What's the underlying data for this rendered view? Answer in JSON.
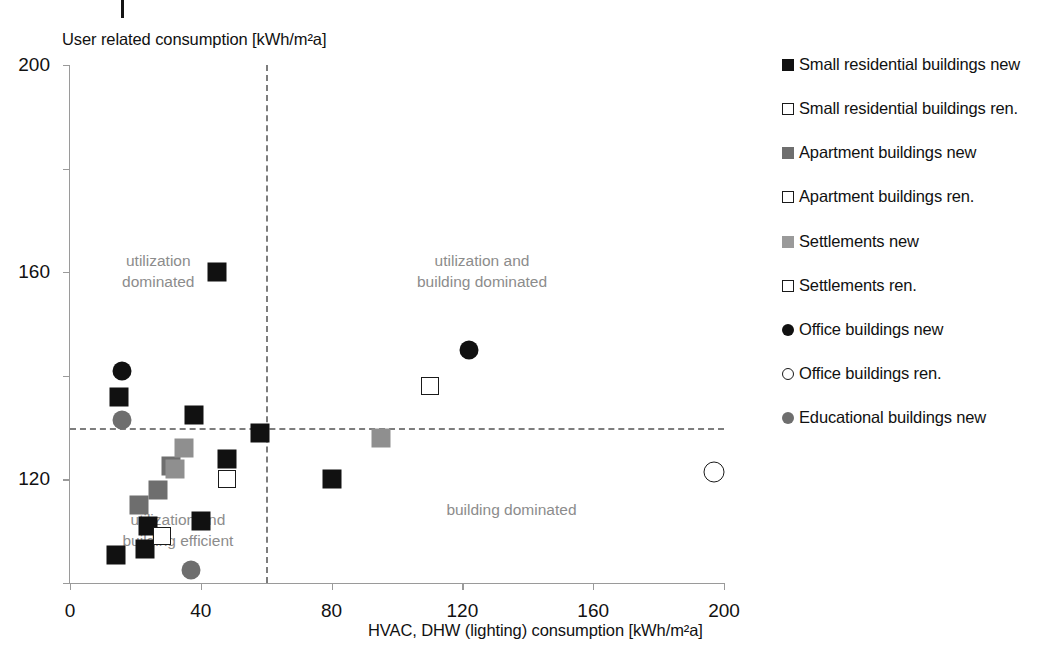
{
  "chart_data": {
    "type": "scatter",
    "title": "",
    "xlabel": "HVAC, DHW (lighting) consumption [kWh/m²a]",
    "ylabel": "User related consumption [kWh/m²a]",
    "xlim": [
      0,
      200
    ],
    "ylim": [
      0,
      200
    ],
    "xticks": [
      0,
      40,
      80,
      120,
      160,
      200
    ],
    "yticks": [
      0,
      40,
      80,
      120,
      160,
      200
    ],
    "grid": false,
    "legend_position": "right",
    "reference_lines": {
      "vertical_x": 60,
      "horizontal_y": 60,
      "style": "dashed",
      "color": "#7d7d7d"
    },
    "annotations": [
      {
        "text": "utilization\ndominated",
        "x": 27,
        "y": 128,
        "color": "#8c8c8c"
      },
      {
        "text": "utilization and\nbuilding  dominated",
        "x": 126,
        "y": 128,
        "color": "#8c8c8c"
      },
      {
        "text": "utilization and\nbuilding  efficient",
        "x": 33,
        "y": 28,
        "color": "#8c8c8c"
      },
      {
        "text": "building  dominated",
        "x": 135,
        "y": 32,
        "color": "#8c8c8c"
      }
    ],
    "series": [
      {
        "name": "Small residential buildings new",
        "marker": "square",
        "fill": "#111111",
        "points": [
          {
            "x": 15,
            "y": 72
          },
          {
            "x": 45,
            "y": 120
          },
          {
            "x": 38,
            "y": 65
          },
          {
            "x": 58,
            "y": 58
          },
          {
            "x": 48,
            "y": 48
          },
          {
            "x": 80,
            "y": 40
          },
          {
            "x": 40,
            "y": 24
          },
          {
            "x": 24,
            "y": 22
          },
          {
            "x": 23,
            "y": 13
          },
          {
            "x": 14,
            "y": 11
          }
        ]
      },
      {
        "name": "Small residential buildings ren.",
        "marker": "square",
        "fill": "#ffffff",
        "points": [
          {
            "x": 48,
            "y": 40
          },
          {
            "x": 28,
            "y": 18
          }
        ]
      },
      {
        "name": "Apartment buildings new",
        "marker": "square",
        "fill": "#6e6e6e",
        "points": [
          {
            "x": 31,
            "y": 45
          },
          {
            "x": 27,
            "y": 36
          },
          {
            "x": 21,
            "y": 30
          }
        ]
      },
      {
        "name": "Apartment buildings ren.",
        "marker": "square",
        "fill": "#ffffff",
        "points": []
      },
      {
        "name": "Settlements new",
        "marker": "square",
        "fill": "#9a9a9a",
        "points": [
          {
            "x": 35,
            "y": 52
          },
          {
            "x": 32,
            "y": 44
          },
          {
            "x": 95,
            "y": 56
          }
        ]
      },
      {
        "name": "Settlements ren.",
        "marker": "square",
        "fill": "#ffffff",
        "points": [
          {
            "x": 110,
            "y": 76
          }
        ]
      },
      {
        "name": "Office buildings new",
        "marker": "circle",
        "fill": "#111111",
        "points": [
          {
            "x": 16,
            "y": 82
          },
          {
            "x": 122,
            "y": 90
          }
        ]
      },
      {
        "name": "Office buildings ren.",
        "marker": "circle",
        "fill": "#ffffff",
        "points": [
          {
            "x": 197,
            "y": 43
          }
        ]
      },
      {
        "name": "Educational buildings new",
        "marker": "circle",
        "fill": "#6e6e6e",
        "points": [
          {
            "x": 16,
            "y": 63
          },
          {
            "x": 37,
            "y": 5
          }
        ]
      }
    ]
  },
  "axes": {
    "y_title": "User related consumption [kWh/m²a]",
    "x_title": "HVAC, DHW (lighting) consumption [kWh/m²a]",
    "y_ticks": [
      "0",
      "40",
      "80",
      "120",
      "160",
      "200"
    ],
    "x_ticks": [
      "0",
      "40",
      "80",
      "120",
      "160",
      "200"
    ]
  },
  "legend": {
    "items": [
      {
        "label": "Small residential buildings new",
        "swatch": "square-filled-black"
      },
      {
        "label": "Small residential buildings ren.",
        "swatch": "square-open"
      },
      {
        "label": "Apartment buildings new",
        "swatch": "square-filled-dark-gray"
      },
      {
        "label": "Apartment buildings ren.",
        "swatch": "square-open"
      },
      {
        "label": "Settlements new",
        "swatch": "square-filled-medium-gray"
      },
      {
        "label": "Settlements ren.",
        "swatch": "square-open"
      },
      {
        "label": "Office buildings new",
        "swatch": "circle-filled-black"
      },
      {
        "label": "Office buildings ren.",
        "swatch": "circle-open"
      },
      {
        "label": "Educational buildings new",
        "swatch": "circle-filled-dark-gray"
      }
    ]
  },
  "annotations": {
    "q_top_left": "utilization\ndominated",
    "q_top_right": "utilization and\nbuilding  dominated",
    "q_bottom_left": "utilization and\nbuilding  efficient",
    "q_bottom_right": "building  dominated"
  },
  "colors": {
    "black": "#111111",
    "dark_gray": "#6e6e6e",
    "medium_gray": "#9a9a9a",
    "divider": "#7d7d7d",
    "annotation_text": "#8c8c8c"
  }
}
